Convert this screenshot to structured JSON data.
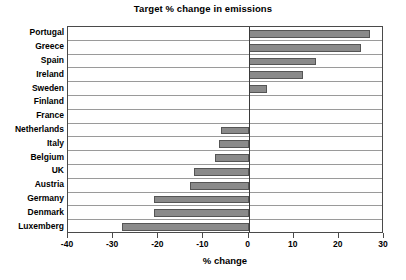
{
  "chart_data": {
    "type": "bar",
    "orientation": "horizontal",
    "title": "Target % change in emissions",
    "xlabel": "% change",
    "ylabel": "",
    "categories": [
      "Portugal",
      "Greece",
      "Spain",
      "Ireland",
      "Sweden",
      "Finland",
      "France",
      "Netherlands",
      "Italy",
      "Belgium",
      "UK",
      "Austria",
      "Germany",
      "Denmark",
      "Luxemberg"
    ],
    "values": [
      27,
      25,
      15,
      12,
      4,
      0,
      0,
      -6,
      -6.5,
      -7.5,
      -12,
      -13,
      -21,
      -21,
      -28
    ],
    "xlim": [
      -40,
      30
    ],
    "xticks": [
      -40,
      -30,
      -20,
      -10,
      0,
      10,
      20,
      30
    ],
    "xtick_labels": [
      "-40",
      "-30",
      "-20",
      "-10",
      "0",
      "10",
      "20",
      "30"
    ],
    "grid": true,
    "legend": false,
    "bar_color": "#8a8a8a",
    "bar_border_color": "#555555",
    "axis_color": "#4a4a4a",
    "gridline_color": "#9a9a9a",
    "zero_line_color": "#3a3a3a",
    "background": "#ffffff"
  }
}
